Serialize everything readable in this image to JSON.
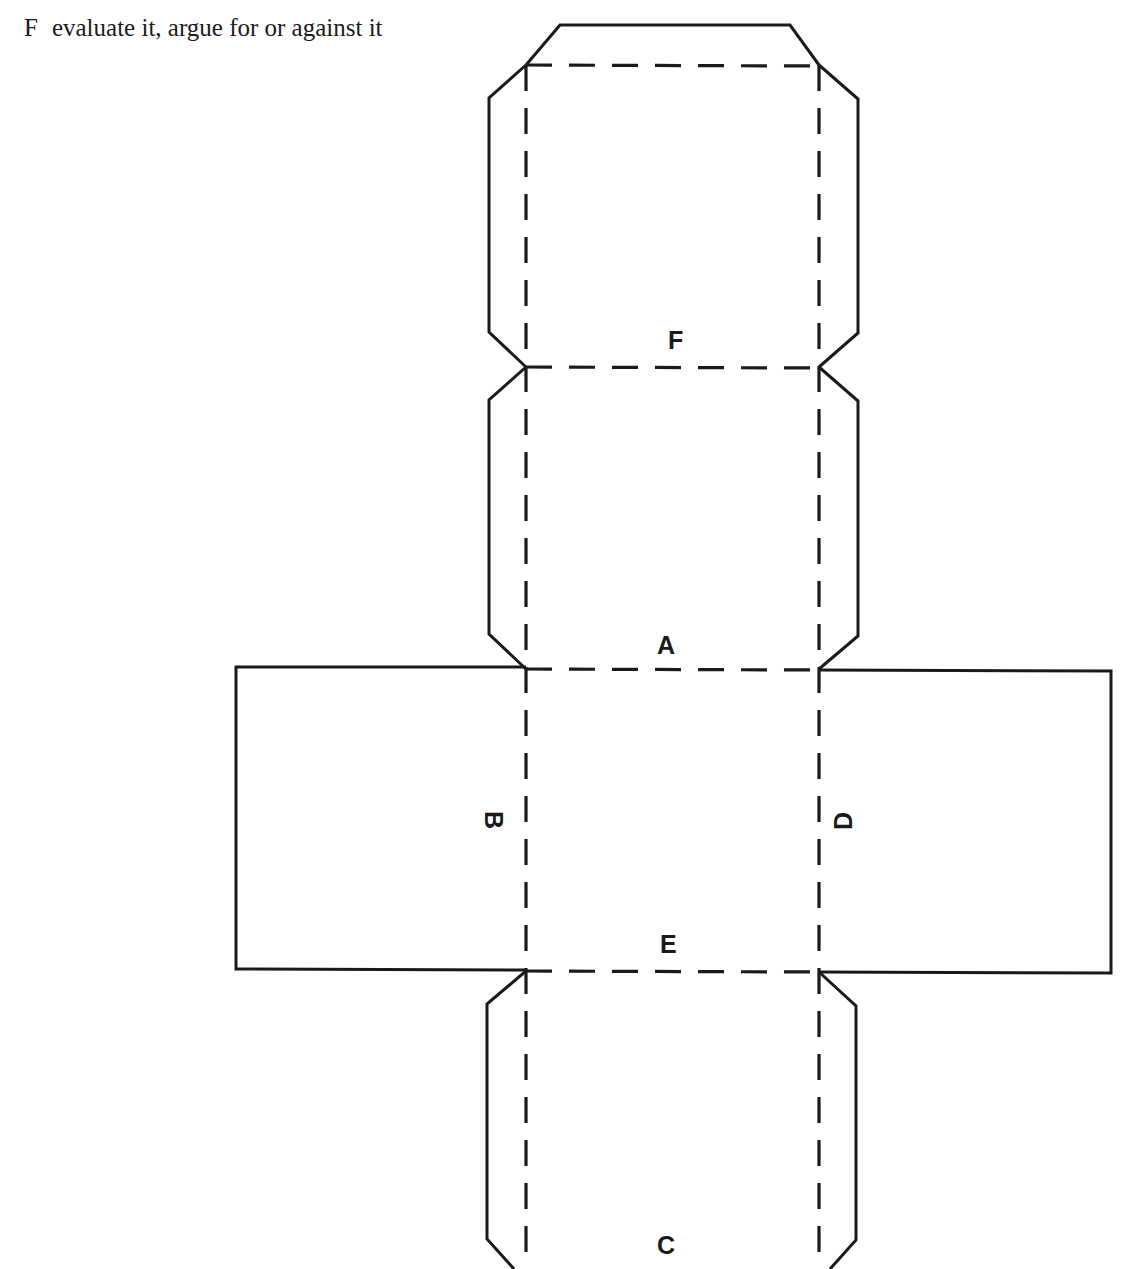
{
  "caption": {
    "letter": "F",
    "text": "evaluate it, argue for or against it"
  },
  "diagram": {
    "line_color": "#1a1a1a",
    "faces": [
      {
        "id": "F",
        "label": "F",
        "position": "top",
        "orientation": "upright"
      },
      {
        "id": "A",
        "label": "A",
        "position": "second",
        "orientation": "upright"
      },
      {
        "id": "B",
        "label": "B",
        "position": "left-wing",
        "orientation": "rotated-90-clockwise"
      },
      {
        "id": "D",
        "label": "D",
        "position": "right-wing",
        "orientation": "rotated-90-counterclockwise"
      },
      {
        "id": "E",
        "label": "E",
        "position": "center",
        "orientation": "upright"
      },
      {
        "id": "C",
        "label": "C",
        "position": "bottom",
        "orientation": "upright"
      }
    ],
    "legend": {
      "solid_line": "cut",
      "dashed_line": "fold"
    }
  }
}
